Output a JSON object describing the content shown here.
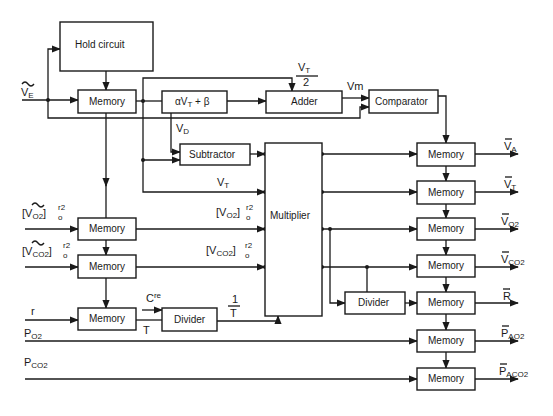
{
  "diagram": {
    "blocks": {
      "hold_circuit": "Hold circuit",
      "memory_main": "Memory",
      "alpha_beta": "αV",
      "alpha_beta_sub": "T",
      "alpha_beta_tail": " + β",
      "adder": "Adder",
      "comparator": "Comparator",
      "subtractor": "Subtractor",
      "multiplier": "Multiplier",
      "memory_vo2": "Memory",
      "memory_vco2": "Memory",
      "memory_r": "Memory",
      "divider_left": "Divider",
      "divider_right": "Divider",
      "memory_va": "Memory",
      "memory_vt": "Memory",
      "memory_out_vo2": "Memory",
      "memory_out_vco2": "Memory",
      "memory_out_r": "Memory",
      "memory_out_pao2": "Memory",
      "memory_out_paco2": "Memory"
    },
    "inputs": {
      "ve_main": "V",
      "ve_sub": "E",
      "vo2_main": "[V",
      "vo2_sub": "O2",
      "vo2_tail": "]",
      "vo2_sup": "r2",
      "vo2_sub2": "o",
      "vco2_main": "[V",
      "vco2_sub": "CO2",
      "vco2_tail": "]",
      "vco2_sup": "r2",
      "vco2_sub2": "o",
      "r": "r",
      "po2_main": "P",
      "po2_sub": "O2",
      "pco2_main": "P",
      "pco2_sub": "CO2"
    },
    "signals": {
      "vt_half_num": "V",
      "vt_half_num_sub": "T",
      "vt_half_den": "2",
      "vm": "Vm",
      "vd_main": "V",
      "vd_sub": "D",
      "vt_main": "V",
      "vt_sub": "T",
      "mult_vo2_main": "[V",
      "mult_vo2_sub": "O2",
      "mult_vo2_tail": "]",
      "mult_vo2_sup": "r2",
      "mult_vo2_sub2": "o",
      "mult_vco2_main": "[V",
      "mult_vco2_sub": "CO2",
      "mult_vco2_tail": "]",
      "mult_vco2_sup": "r2",
      "mult_vco2_sub2": "o",
      "cre_main": "C",
      "cre_sup": "re",
      "t_label": "T",
      "inv_t_num": "1",
      "inv_t_den": "T"
    },
    "outputs": {
      "va_main": "V",
      "va_sub": "A",
      "vt_main": "V",
      "vt_sub": "T",
      "vo2_main": "V",
      "vo2_sub": "O2",
      "vco2_main": "V",
      "vco2_sub": "CO2",
      "r_main": "R",
      "pao2_main": "P",
      "pao2_sub": "AO2",
      "paco2_main": "P",
      "paco2_sub": "ACO2"
    }
  }
}
